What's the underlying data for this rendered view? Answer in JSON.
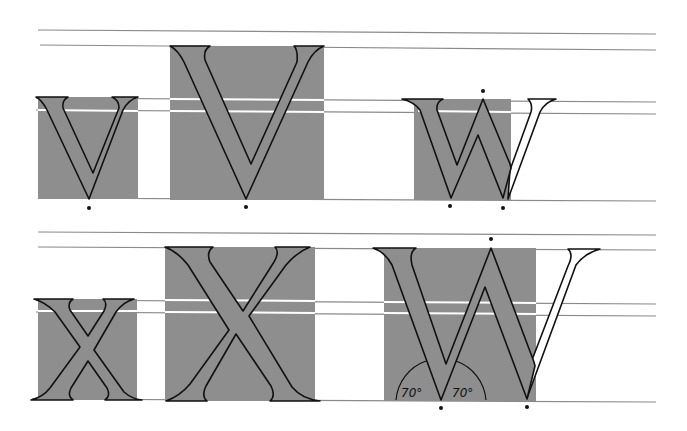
{
  "figure": {
    "colors": {
      "box_fill": "#8e8e8e",
      "guide_line": "#8a8a8a",
      "outline": "#111111",
      "background": "#ffffff"
    }
  },
  "rows": [
    {
      "name": "top-row",
      "letters": [
        {
          "char": "V",
          "size": "small"
        },
        {
          "char": "V",
          "size": "large"
        },
        {
          "char": "W",
          "size": "small"
        }
      ]
    },
    {
      "name": "bottom-row",
      "letters": [
        {
          "char": "X",
          "size": "small"
        },
        {
          "char": "X",
          "size": "large"
        },
        {
          "char": "W",
          "size": "large"
        }
      ]
    }
  ],
  "annotations": {
    "left_angle": "70°",
    "right_angle": "70°"
  }
}
